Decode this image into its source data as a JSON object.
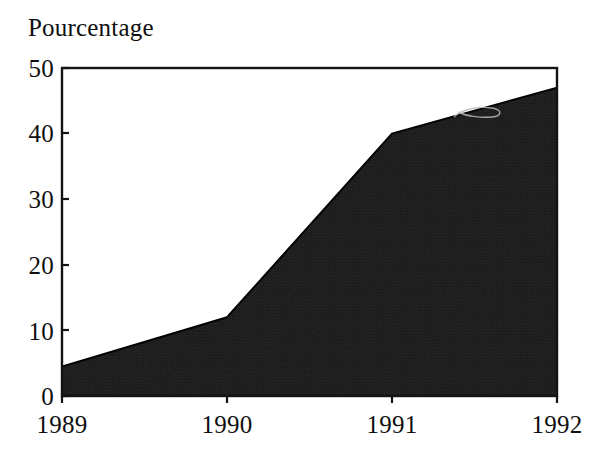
{
  "chart_data": {
    "type": "area",
    "title": "",
    "ylabel": "Pourcentage",
    "xlabel": "",
    "categories": [
      "1989",
      "1990",
      "1991",
      "1992"
    ],
    "x": [
      1989,
      1990,
      1991,
      1992
    ],
    "values": [
      4.5,
      12,
      40,
      47
    ],
    "series": [
      {
        "name": "Pourcentage",
        "values": [
          4.5,
          12,
          40,
          47
        ],
        "fill_color": "#161616",
        "line_color": "#000000"
      }
    ],
    "ylim": [
      0,
      50
    ],
    "yticks": [
      0,
      10,
      20,
      30,
      40,
      50
    ],
    "ytick_labels": [
      "0",
      "10",
      "20",
      "30",
      "40",
      "50"
    ],
    "xticks": [
      1989,
      1990,
      1991,
      1992
    ],
    "xtick_labels": [
      "1989",
      "1990",
      "1991",
      "1992"
    ],
    "grid": false,
    "legend": false,
    "legend_position": "none",
    "frame": "full-box",
    "annotations": []
  },
  "axis": {
    "y_title": "Pourcentage",
    "y_labels": [
      "50",
      "40",
      "30",
      "20",
      "10",
      "0"
    ],
    "x_labels": [
      "1989",
      "1990",
      "1991",
      "1992"
    ]
  },
  "colors": {
    "background": "#ffffff",
    "ink": "#0d0d0d",
    "area_fill": "#161616",
    "frame": "#111111"
  }
}
